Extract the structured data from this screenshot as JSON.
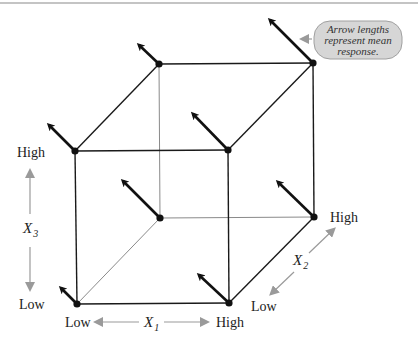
{
  "diagram": {
    "type": "cube-factorial-design",
    "callout": {
      "lines": [
        "Arrow lengths",
        "represent mean",
        "response."
      ]
    },
    "axes": {
      "x1": {
        "name": "X",
        "subscript": "1",
        "low_label": "Low",
        "high_label": "High"
      },
      "x2": {
        "name": "X",
        "subscript": "2",
        "low_label": "Low",
        "high_label": "High"
      },
      "x3": {
        "name": "X",
        "subscript": "3",
        "low_label": "Low",
        "high_label": "High"
      }
    },
    "colors": {
      "front_edge": "#1a1a1a",
      "hidden_edge": "#8a8a8a",
      "vertex": "#111111",
      "response_arrow": "#111111",
      "axis_arrow": "#9a9a9a",
      "callout_fill": "#d6d6d6",
      "callout_stroke": "#a0a0a0",
      "frame_line": "#8a8a8a"
    },
    "vertices": [
      {
        "id": "front-bottom-left",
        "x1": "Low",
        "x2": "Low",
        "x3": "Low",
        "x": 77,
        "y": 304,
        "arrow_tip": [
          61,
          288
        ]
      },
      {
        "id": "front-bottom-right",
        "x1": "High",
        "x2": "Low",
        "x3": "Low",
        "x": 229,
        "y": 303,
        "arrow_tip": [
          199,
          275
        ]
      },
      {
        "id": "front-top-left",
        "x1": "Low",
        "x2": "Low",
        "x3": "High",
        "x": 75,
        "y": 151,
        "arrow_tip": [
          49,
          125
        ]
      },
      {
        "id": "front-top-right",
        "x1": "High",
        "x2": "Low",
        "x3": "High",
        "x": 228,
        "y": 150,
        "arrow_tip": [
          193,
          114
        ]
      },
      {
        "id": "back-bottom-left",
        "x1": "Low",
        "x2": "High",
        "x3": "Low",
        "x": 160,
        "y": 218,
        "arrow_tip": [
          123,
          181
        ]
      },
      {
        "id": "back-bottom-right",
        "x1": "High",
        "x2": "High",
        "x3": "Low",
        "x": 314,
        "y": 217,
        "arrow_tip": [
          278,
          182
        ]
      },
      {
        "id": "back-top-left",
        "x1": "Low",
        "x2": "High",
        "x3": "High",
        "x": 159,
        "y": 64,
        "arrow_tip": [
          139,
          45
        ]
      },
      {
        "id": "back-top-right",
        "x1": "High",
        "x2": "High",
        "x3": "High",
        "x": 313,
        "y": 63,
        "arrow_tip": [
          270,
          20
        ]
      }
    ]
  }
}
